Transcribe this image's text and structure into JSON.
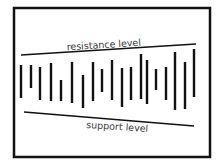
{
  "diagram": {
    "frame": {
      "x": 14,
      "y": 8,
      "width": 196,
      "height": 149,
      "stroke": "#111111",
      "stroke_width": 2.5
    },
    "lines": {
      "resistance": {
        "label": "resistance level",
        "x1": 21,
        "y1": 55,
        "x2": 196,
        "y2": 44,
        "label_x": 104,
        "label_y": 48,
        "label_rotate": -3.6
      },
      "support": {
        "label": "support level",
        "x1": 24,
        "y1": 112,
        "x2": 194,
        "y2": 126,
        "label_x": 117,
        "label_y": 130,
        "label_rotate": 3.6
      }
    },
    "bars": [
      {
        "x": 21,
        "top": 65,
        "bottom": 98
      },
      {
        "x": 31,
        "top": 65,
        "bottom": 88
      },
      {
        "x": 40,
        "top": 67,
        "bottom": 100
      },
      {
        "x": 51,
        "top": 63,
        "bottom": 101
      },
      {
        "x": 61,
        "top": 80,
        "bottom": 101
      },
      {
        "x": 72,
        "top": 62,
        "bottom": 103
      },
      {
        "x": 83,
        "top": 75,
        "bottom": 108
      },
      {
        "x": 93,
        "top": 62,
        "bottom": 101
      },
      {
        "x": 102,
        "top": 69,
        "bottom": 92
      },
      {
        "x": 112,
        "top": 60,
        "bottom": 100
      },
      {
        "x": 122,
        "top": 68,
        "bottom": 107
      },
      {
        "x": 131,
        "top": 67,
        "bottom": 100
      },
      {
        "x": 141,
        "top": 54,
        "bottom": 99
      },
      {
        "x": 147,
        "top": 60,
        "bottom": 104
      },
      {
        "x": 156,
        "top": 69,
        "bottom": 90
      },
      {
        "x": 166,
        "top": 67,
        "bottom": 100
      },
      {
        "x": 175,
        "top": 52,
        "bottom": 110
      },
      {
        "x": 185,
        "top": 62,
        "bottom": 109
      },
      {
        "x": 194,
        "top": 49,
        "bottom": 97
      }
    ],
    "colors": {
      "ink": "#111111",
      "text": "#3a3a3a",
      "background": "#ffffff"
    }
  }
}
